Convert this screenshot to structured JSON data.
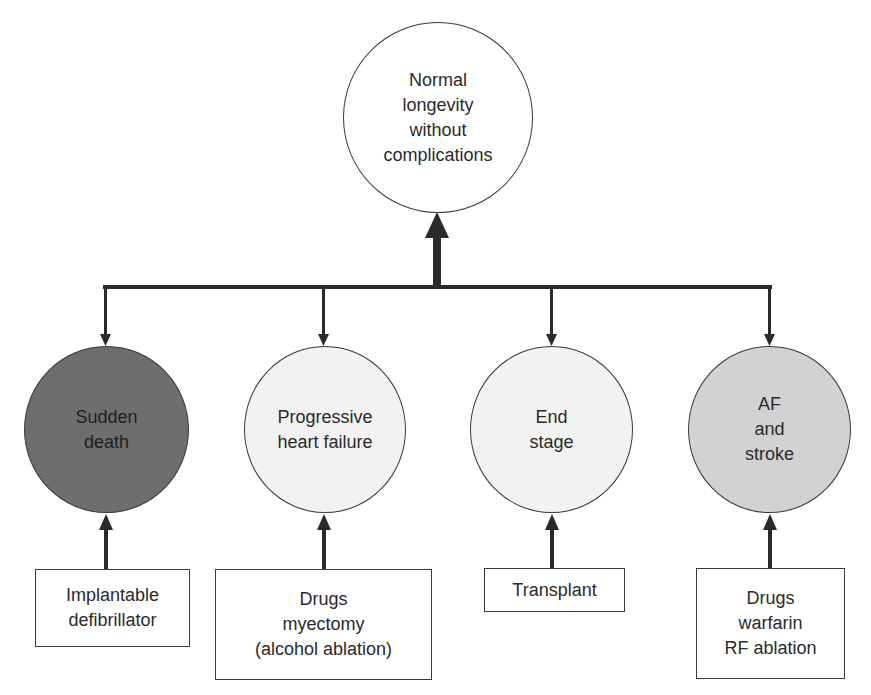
{
  "diagram": {
    "goal": {
      "label": "Normal\nlongevity\nwithout\ncomplications",
      "fill": "#ffffff"
    },
    "outcomes": [
      {
        "label": "Sudden\ndeath",
        "fill": "#6e6e6e"
      },
      {
        "label": "Progressive\nheart failure",
        "fill": "#f2f2f2"
      },
      {
        "label": "End\nstage",
        "fill": "#f2f2f2"
      },
      {
        "label": "AF\nand\nstroke",
        "fill": "#d2d2d2"
      }
    ],
    "treatments": [
      {
        "label": "Implantable\ndefibrillator"
      },
      {
        "label": "Drugs\nmyectomy\n(alcohol ablation)"
      },
      {
        "label": "Transplant"
      },
      {
        "label": "Drugs\nwarfarin\nRF ablation"
      }
    ],
    "colors": {
      "line": "#2a2a2a",
      "text": "#2a2a2a",
      "background": "#ffffff"
    }
  }
}
